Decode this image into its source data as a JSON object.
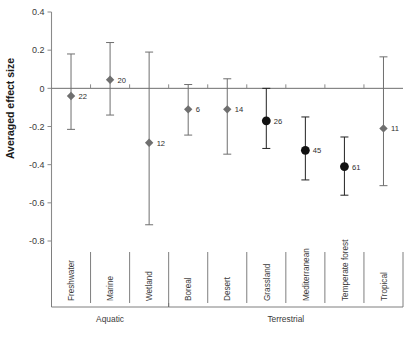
{
  "chart_data": {
    "type": "scatter",
    "title": "",
    "xlabel": "",
    "ylabel": "Averaged effect size",
    "ylim": [
      -0.8,
      0.4
    ],
    "ytick_labels": [
      "0.4",
      "0.2",
      "0",
      "-0.2",
      "-0.4",
      "-0.6",
      "-0.8"
    ],
    "ytick_values": [
      0.4,
      0.2,
      0,
      -0.2,
      -0.4,
      -0.6,
      -0.8
    ],
    "grid": false,
    "legend": "none",
    "reference_line": 0,
    "categories": [
      "Freshwater",
      "Marine",
      "Wetland",
      "Boreal",
      "Desert",
      "Grassland",
      "Mediterranean",
      "Temperate forest",
      "Tropical"
    ],
    "groups": [
      {
        "label": "Aquatic",
        "categories": [
          "Freshwater",
          "Marine",
          "Wetland"
        ]
      },
      {
        "label": "Terrestrial",
        "categories": [
          "Boreal",
          "Desert",
          "Grassland",
          "Mediterranean",
          "Temperate forest",
          "Tropical"
        ]
      }
    ],
    "points": [
      {
        "category": "Freshwater",
        "value": -0.04,
        "ci_low": -0.215,
        "ci_high": 0.18,
        "n": "22",
        "marker": "diamond",
        "color": "#6f6f6f"
      },
      {
        "category": "Marine",
        "value": 0.045,
        "ci_low": -0.14,
        "ci_high": 0.24,
        "n": "20",
        "marker": "diamond",
        "color": "#6f6f6f"
      },
      {
        "category": "Wetland",
        "value": -0.285,
        "ci_low": -0.715,
        "ci_high": 0.19,
        "n": "12",
        "marker": "diamond",
        "color": "#6f6f6f"
      },
      {
        "category": "Boreal",
        "value": -0.11,
        "ci_low": -0.245,
        "ci_high": 0.02,
        "n": "6",
        "marker": "diamond",
        "color": "#6f6f6f"
      },
      {
        "category": "Desert",
        "value": -0.11,
        "ci_low": -0.345,
        "ci_high": 0.05,
        "n": "14",
        "marker": "diamond",
        "color": "#6f6f6f"
      },
      {
        "category": "Grassland",
        "value": -0.17,
        "ci_low": -0.315,
        "ci_high": 0.0,
        "n": "26",
        "marker": "circle",
        "color": "#111111"
      },
      {
        "category": "Mediterranean",
        "value": -0.325,
        "ci_low": -0.48,
        "ci_high": -0.15,
        "n": "45",
        "marker": "circle",
        "color": "#111111"
      },
      {
        "category": "Temperate forest",
        "value": -0.41,
        "ci_low": -0.56,
        "ci_high": -0.255,
        "n": "61",
        "marker": "circle",
        "color": "#111111"
      },
      {
        "category": "Tropical",
        "value": -0.21,
        "ci_low": -0.51,
        "ci_high": 0.165,
        "n": "11",
        "marker": "diamond",
        "color": "#6f6f6f"
      }
    ]
  }
}
